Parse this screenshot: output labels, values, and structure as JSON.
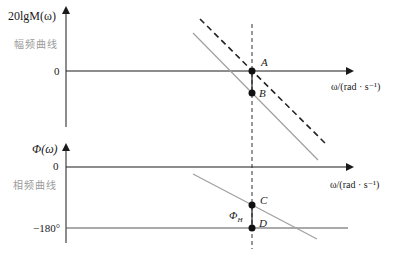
{
  "diagram": {
    "type": "bode-plot-gain-phase-margin",
    "magnitude_plot": {
      "y_axis_label": "20lgM(ω)",
      "side_label": "幅频曲线",
      "zero_tick": "0",
      "x_axis_label": "ω/(rad · s⁻¹)",
      "points": [
        {
          "name": "A",
          "label": "A"
        },
        {
          "name": "B",
          "label": "B"
        }
      ]
    },
    "phase_plot": {
      "y_axis_label": "Φ(ω)",
      "side_label": "相频曲线",
      "zero_tick": "0",
      "minus180_tick": "−180°",
      "x_axis_label": "ω/(rad · s⁻¹)",
      "margin_label": "Φ",
      "margin_subscript": "H",
      "points": [
        {
          "name": "C",
          "label": "C"
        },
        {
          "name": "D",
          "label": "D"
        }
      ]
    },
    "colors": {
      "axis": "#1a1a1a",
      "gray_curve": "#a0a0a0",
      "dashed_curve": "#222222",
      "side_label": "#9a9a9a"
    }
  }
}
